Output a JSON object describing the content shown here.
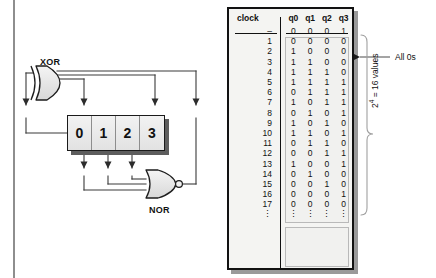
{
  "circuit": {
    "xor_gate_label": "XOR",
    "nor_gate_label": "NOR",
    "register_cells": [
      "0",
      "1",
      "2",
      "3"
    ]
  },
  "table": {
    "headers": [
      "clock",
      "q0",
      "q1",
      "q2",
      "q3"
    ],
    "rows": [
      {
        "clock": "–",
        "q": [
          "0",
          "0",
          "0",
          "1"
        ]
      },
      {
        "clock": "1",
        "q": [
          "0",
          "0",
          "0",
          "0"
        ]
      },
      {
        "clock": "2",
        "q": [
          "1",
          "0",
          "0",
          "0"
        ]
      },
      {
        "clock": "3",
        "q": [
          "1",
          "1",
          "0",
          "0"
        ]
      },
      {
        "clock": "4",
        "q": [
          "1",
          "1",
          "1",
          "0"
        ]
      },
      {
        "clock": "5",
        "q": [
          "1",
          "1",
          "1",
          "1"
        ]
      },
      {
        "clock": "6",
        "q": [
          "0",
          "1",
          "1",
          "1"
        ]
      },
      {
        "clock": "7",
        "q": [
          "1",
          "0",
          "1",
          "1"
        ]
      },
      {
        "clock": "8",
        "q": [
          "0",
          "1",
          "0",
          "1"
        ]
      },
      {
        "clock": "9",
        "q": [
          "1",
          "0",
          "1",
          "0"
        ]
      },
      {
        "clock": "10",
        "q": [
          "1",
          "1",
          "0",
          "1"
        ]
      },
      {
        "clock": "11",
        "q": [
          "0",
          "1",
          "1",
          "0"
        ]
      },
      {
        "clock": "12",
        "q": [
          "0",
          "0",
          "1",
          "1"
        ]
      },
      {
        "clock": "13",
        "q": [
          "1",
          "0",
          "0",
          "1"
        ]
      },
      {
        "clock": "14",
        "q": [
          "0",
          "1",
          "0",
          "0"
        ]
      },
      {
        "clock": "15",
        "q": [
          "0",
          "0",
          "1",
          "0"
        ]
      }
    ],
    "repeat_rows": [
      {
        "clock": "16",
        "q": [
          "0",
          "0",
          "0",
          "1"
        ]
      },
      {
        "clock": "17",
        "q": [
          "0",
          "0",
          "0",
          "0"
        ]
      },
      {
        "clock": "⋮",
        "q": [
          "⋮",
          "⋮",
          "⋮",
          "⋮"
        ]
      }
    ]
  },
  "annotations": {
    "all_zeros": "All 0s",
    "values_count_pre": "2",
    "values_count_exp": "4",
    "values_count_post": " = 16 values"
  },
  "colors": {
    "ink": "#111111",
    "wire": "#3a3a3a",
    "gate_fill": "#e8e8e8",
    "register_fill": "#e9e9e9",
    "shadow": "#5d5d5d",
    "panel_bg": "#f4f4f2",
    "rule": "#8e8e8e"
  }
}
